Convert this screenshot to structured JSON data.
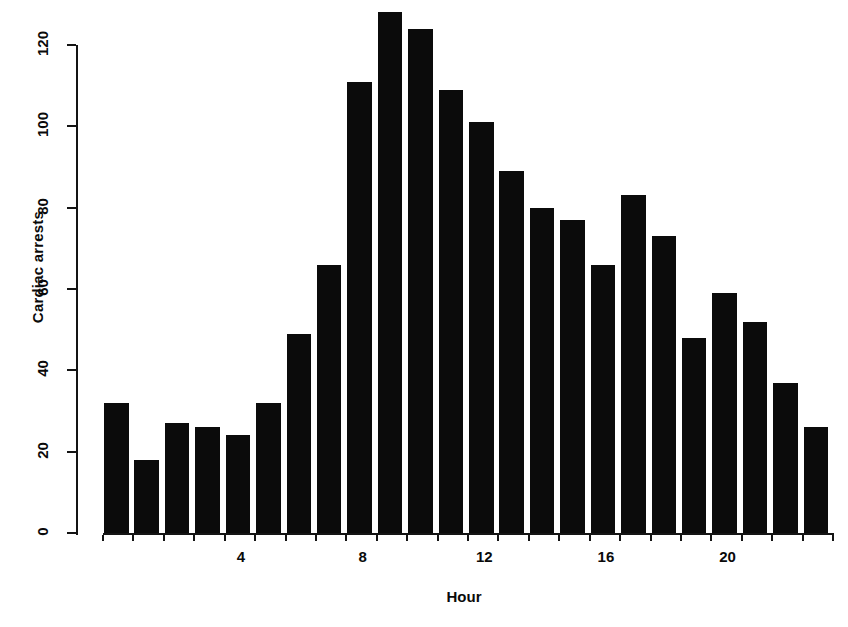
{
  "chart_data": {
    "type": "bar",
    "title": "",
    "xlabel": "Hour",
    "ylabel": "Cardiac arrests",
    "categories": [
      0,
      1,
      2,
      3,
      4,
      5,
      6,
      7,
      8,
      9,
      10,
      11,
      12,
      13,
      14,
      15,
      16,
      17,
      18,
      19,
      20,
      21,
      22,
      23
    ],
    "values": [
      32,
      18,
      27,
      26,
      24,
      32,
      49,
      66,
      111,
      128,
      124,
      109,
      101,
      89,
      80,
      77,
      66,
      83,
      73,
      48,
      59,
      52,
      37,
      26
    ],
    "xlim": [
      -0.5,
      23.5
    ],
    "ylim": [
      0,
      120
    ],
    "xticks": [
      4,
      8,
      12,
      16,
      20
    ],
    "xtick_labels": [
      "4",
      "8",
      "12",
      "16",
      "20"
    ],
    "yticks": [
      0,
      20,
      40,
      60,
      80,
      100,
      120
    ],
    "ytick_labels": [
      "0",
      "20",
      "40",
      "60",
      "80",
      "100",
      "120"
    ],
    "grid": false,
    "legend": false,
    "bar_color": "#0b0b0b",
    "axis_color": "#141414",
    "background": "#ffffff"
  }
}
